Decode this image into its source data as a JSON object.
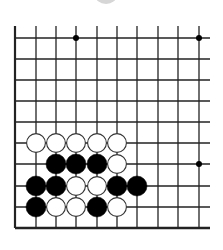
{
  "game": "go",
  "board": {
    "columns_x": [
      15,
      36,
      56,
      76,
      97,
      117,
      137,
      158,
      178,
      199
    ],
    "rows_y": [
      38,
      59,
      80,
      101,
      122,
      143,
      164,
      186,
      207,
      228
    ],
    "line_top": 26,
    "line_right": 210,
    "line_color": "#222222",
    "edges": {
      "left": true,
      "bottom": true,
      "top": false,
      "right": false
    },
    "star_points": [
      {
        "col": 3,
        "row": 0
      },
      {
        "col": 9,
        "row": 0
      },
      {
        "col": 9,
        "row": 6
      }
    ],
    "stone_radius": 10
  },
  "stones": [
    {
      "color": "white",
      "col": 1,
      "row": 5
    },
    {
      "color": "white",
      "col": 2,
      "row": 5
    },
    {
      "color": "white",
      "col": 3,
      "row": 5
    },
    {
      "color": "white",
      "col": 4,
      "row": 5
    },
    {
      "color": "white",
      "col": 5,
      "row": 5
    },
    {
      "color": "black",
      "col": 2,
      "row": 6
    },
    {
      "color": "black",
      "col": 3,
      "row": 6
    },
    {
      "color": "black",
      "col": 4,
      "row": 6
    },
    {
      "color": "white",
      "col": 5,
      "row": 6
    },
    {
      "color": "black",
      "col": 1,
      "row": 7
    },
    {
      "color": "black",
      "col": 2,
      "row": 7
    },
    {
      "color": "white",
      "col": 3,
      "row": 7
    },
    {
      "color": "white",
      "col": 4,
      "row": 7
    },
    {
      "color": "black",
      "col": 5,
      "row": 7
    },
    {
      "color": "black",
      "col": 6,
      "row": 7
    },
    {
      "color": "black",
      "col": 1,
      "row": 8
    },
    {
      "color": "white",
      "col": 2,
      "row": 8
    },
    {
      "color": "white",
      "col": 3,
      "row": 8
    },
    {
      "color": "black",
      "col": 4,
      "row": 8
    },
    {
      "color": "white",
      "col": 5,
      "row": 8
    }
  ],
  "colors": {
    "black_stone": "#000000",
    "white_stone": "#ffffff",
    "white_stone_outline": "#333333",
    "background": "#ffffff",
    "top_hint": "#d6d6d6"
  }
}
